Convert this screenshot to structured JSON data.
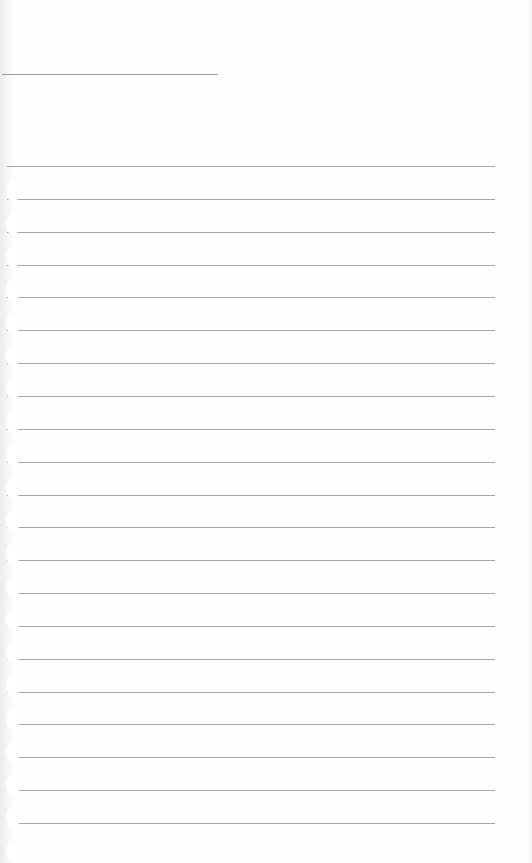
{
  "page": {
    "type": "blank lined notebook paper",
    "header_line": true,
    "rule_count": 21,
    "rule_color": "#a8a8a8",
    "background_color": "#fefefe"
  }
}
